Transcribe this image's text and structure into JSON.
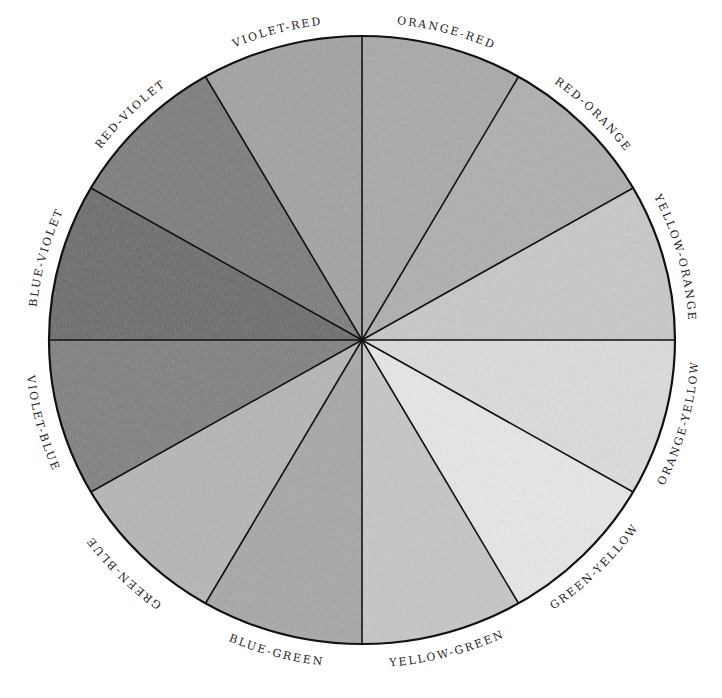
{
  "diagram": {
    "type": "color-wheel",
    "center": [
      362,
      340
    ],
    "radius_x": 313,
    "radius_y": 304,
    "segments": [
      {
        "label": "ORANGE-RED",
        "start_deg": 0,
        "shade": "#a9a9a9"
      },
      {
        "label": "RED-ORANGE",
        "start_deg": 30,
        "shade": "#afafaf"
      },
      {
        "label": "YELLOW-ORANGE",
        "start_deg": 60,
        "shade": "#c8c8c8"
      },
      {
        "label": "ORANGE-YELLOW",
        "start_deg": 90,
        "shade": "#dcdcdc"
      },
      {
        "label": "GREEN-YELLOW",
        "start_deg": 120,
        "shade": "#e6e6e6"
      },
      {
        "label": "YELLOW-GREEN",
        "start_deg": 150,
        "shade": "#c6c6c6"
      },
      {
        "label": "BLUE-GREEN",
        "start_deg": 180,
        "shade": "#a7a7a7"
      },
      {
        "label": "GREEN-BLUE",
        "start_deg": 210,
        "shade": "#b6b6b6"
      },
      {
        "label": "VIOLET-BLUE",
        "start_deg": 240,
        "shade": "#808080"
      },
      {
        "label": "BLUE-VIOLET",
        "start_deg": 270,
        "shade": "#6b6b6b"
      },
      {
        "label": "RED-VIOLET",
        "start_deg": 300,
        "shade": "#7c7c7c"
      },
      {
        "label": "VIOLET-RED",
        "start_deg": 330,
        "shade": "#a3a3a3"
      }
    ]
  }
}
